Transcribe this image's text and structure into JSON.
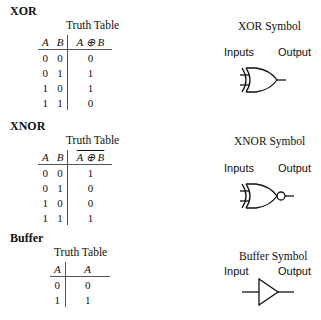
{
  "sections": [
    {
      "name": "XOR",
      "truth_table_title": "Truth Table",
      "headers": [
        "A",
        "B",
        "A ⊕ B"
      ],
      "rows": [
        [
          "0",
          "0",
          "0"
        ],
        [
          "0",
          "1",
          "1"
        ],
        [
          "1",
          "0",
          "1"
        ],
        [
          "1",
          "1",
          "0"
        ]
      ],
      "symbol_title": "XOR Symbol",
      "inputs_label": "Inputs",
      "output_label": "Output"
    },
    {
      "name": "XNOR",
      "truth_table_title": "Truth Table",
      "headers": [
        "A",
        "B",
        "A ⊕ B"
      ],
      "output_overlined": true,
      "rows": [
        [
          "0",
          "0",
          "1"
        ],
        [
          "0",
          "1",
          "0"
        ],
        [
          "1",
          "0",
          "0"
        ],
        [
          "1",
          "1",
          "1"
        ]
      ],
      "symbol_title": "XNOR Symbol",
      "inputs_label": "Inputs",
      "output_label": "Output"
    },
    {
      "name": "Buffer",
      "truth_table_title": "Truth Table",
      "headers": [
        "A",
        "A"
      ],
      "rows": [
        [
          "0",
          "0"
        ],
        [
          "1",
          "1"
        ]
      ],
      "symbol_title": "Buffer Symbol",
      "inputs_label": "Input",
      "output_label": "Output"
    }
  ]
}
